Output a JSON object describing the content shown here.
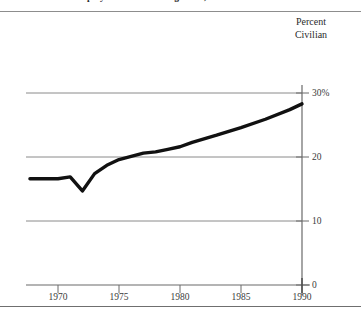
{
  "title": "Share of Civilian Employment in Public Agencies, 1968-1990",
  "header": {
    "line1": "Percent",
    "line2": "Civilian"
  },
  "colors": {
    "line": "#111111",
    "grid": "#8a8a8a",
    "axis": "#6a6a6a",
    "text": "#2b2b2b",
    "background": "#ffffff"
  },
  "chart_data": {
    "type": "line",
    "title": "Share of Civilian Employment in Public Agencies, 1968-1990",
    "xlabel": "",
    "ylabel": "Percent Civilian",
    "xlim": [
      1967,
      1991
    ],
    "ylim": [
      0,
      32
    ],
    "grid": true,
    "legend": null,
    "xticks": [
      1970,
      1975,
      1980,
      1985,
      1990
    ],
    "xtick_labels": [
      "1970",
      "1975",
      "1980",
      "1985",
      "1990"
    ],
    "yticks": [
      0,
      10,
      20,
      30
    ],
    "ytick_labels": [
      "0",
      "10",
      "20",
      "30%"
    ],
    "series": [
      {
        "name": "Percent Civilian",
        "x": [
          1967.7,
          1969.0,
          1970.0,
          1971.0,
          1972.0,
          1973.0,
          1974.0,
          1975.0,
          1976.0,
          1977.0,
          1978.0,
          1979.0,
          1980.0,
          1981.0,
          1983.0,
          1985.0,
          1987.0,
          1989.0,
          1990.0
        ],
        "values": [
          16.6,
          16.6,
          16.6,
          16.9,
          14.7,
          17.4,
          18.7,
          19.6,
          20.1,
          20.6,
          20.8,
          21.2,
          21.6,
          22.3,
          23.4,
          24.6,
          25.9,
          27.4,
          28.3
        ]
      }
    ]
  }
}
